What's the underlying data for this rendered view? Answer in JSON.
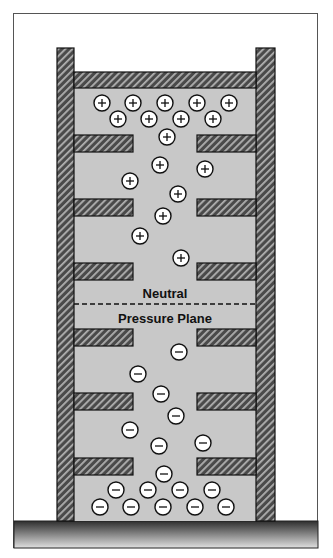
{
  "diagram": {
    "labels": {
      "neutral_line1": "Neutral",
      "neutral_line2": "Pressure Plane"
    },
    "colors": {
      "interior": "#c8c8c8",
      "wall_dark": "#4a4a4a",
      "wall_stripe": "#b0b0b0",
      "ground_top": "#2e2e2e",
      "ground_bottom": "#e0e0e0",
      "ion_fill": "#ffffff",
      "outline": "#111111"
    },
    "positive_ions": [
      [
        102,
        103
      ],
      [
        133,
        103
      ],
      [
        165,
        103
      ],
      [
        197,
        103
      ],
      [
        229,
        103
      ],
      [
        118,
        119
      ],
      [
        149,
        119
      ],
      [
        181,
        119
      ],
      [
        213,
        119
      ],
      [
        167,
        137
      ],
      [
        160,
        165
      ],
      [
        205,
        169
      ],
      [
        130,
        181
      ],
      [
        178,
        194
      ],
      [
        163,
        216
      ],
      [
        140,
        236
      ],
      [
        181,
        258
      ]
    ],
    "negative_ions": [
      [
        179,
        352
      ],
      [
        138,
        374
      ],
      [
        161,
        394
      ],
      [
        176,
        416
      ],
      [
        130,
        430
      ],
      [
        159,
        446
      ],
      [
        203,
        443
      ],
      [
        164,
        474
      ],
      [
        116,
        490
      ],
      [
        148,
        490
      ],
      [
        180,
        490
      ],
      [
        212,
        490
      ],
      [
        100,
        507
      ],
      [
        131,
        507
      ],
      [
        163,
        507
      ],
      [
        195,
        507
      ],
      [
        226,
        507
      ]
    ],
    "floor_shelves_y": [
      135,
      199,
      263,
      329,
      393,
      458
    ]
  }
}
